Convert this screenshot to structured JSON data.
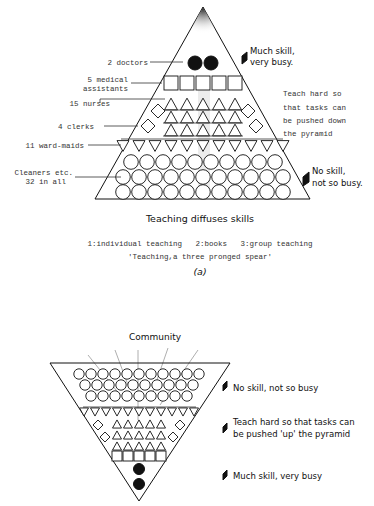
{
  "figure_a": {
    "labels": {
      "doctors": "2 doctors",
      "medical_assistants_1": "5 medical",
      "medical_assistants_2": "assistants",
      "nurses": "15 nurses",
      "clerks": "4 clerks",
      "ward_maids": "11 ward-maids",
      "cleaners_1": "Cleaners etc.",
      "cleaners_2": "32 in all"
    },
    "counts": {
      "doctors": 2,
      "medical_assistants": 5,
      "nurses": 15,
      "clerks": 4,
      "ward_maids": 11,
      "cleaners": 32,
      "cleaner_rows": [
        10,
        11,
        11
      ]
    },
    "notes": {
      "top_1": "Much skill,",
      "top_2": "very busy.",
      "middle_1": "Teach hard so",
      "middle_2": "that tasks can",
      "middle_3": "be pushed down",
      "middle_4": "the pyramid",
      "bottom_1": "No skill,",
      "bottom_2": "not so busy."
    },
    "title": "Teaching diffuses skills",
    "legend": "1:individual teaching   2:books   3:group teaching",
    "subtitle": "'Teaching,a three pronged spear'",
    "panel_label": "(a)"
  },
  "figure_b": {
    "top_label": "Community",
    "counts": {
      "circle_rows": [
        11,
        10,
        9
      ],
      "ward_maids": 11,
      "clerks": 4,
      "nurses": 15,
      "medical_assistants": 5,
      "doctors": 2
    },
    "notes": {
      "top": "No skill, not so busy",
      "middle_1": "Teach hard so that tasks can",
      "middle_2": "be pushed 'up' the pyramid",
      "bottom": "Much skill, very busy"
    }
  }
}
